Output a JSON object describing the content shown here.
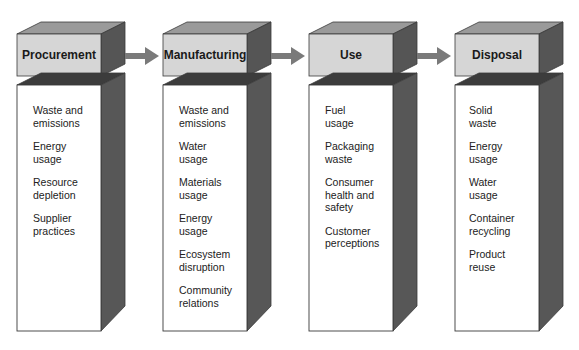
{
  "diagram": {
    "colors": {
      "header_front": "#d6d6d6",
      "header_top": "#9a9a9a",
      "side": "#555555",
      "body_front": "#ffffff",
      "arrow": "#7a7a7a",
      "outline": "#3a3a3a"
    },
    "stages": [
      {
        "title": "Procurement",
        "items": [
          "Waste and\nemissions",
          "Energy\nusage",
          "Resource\ndepletion",
          "Supplier\npractices"
        ]
      },
      {
        "title": "Manufacturing",
        "items": [
          "Waste and\nemissions",
          "Water\nusage",
          "Materials\nusage",
          "Energy\nusage",
          "Ecosystem\ndisruption",
          "Community\nrelations"
        ]
      },
      {
        "title": "Use",
        "items": [
          "Fuel\nusage",
          "Packaging\nwaste",
          "Consumer\nhealth and\nsafety",
          "Customer\nperceptions"
        ]
      },
      {
        "title": "Disposal",
        "items": [
          "Solid\nwaste",
          "Energy\nusage",
          "Water\nusage",
          "Container\nrecycling",
          "Product\nreuse"
        ]
      }
    ],
    "arrows": [
      "arrow-right-icon",
      "arrow-right-icon",
      "arrow-right-icon"
    ]
  }
}
